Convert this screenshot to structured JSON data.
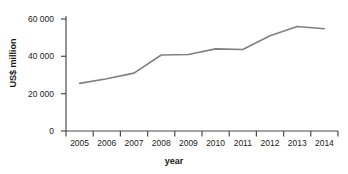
{
  "chart_data": {
    "type": "line",
    "title": "",
    "xlabel": "year",
    "ylabel": "US$ million",
    "x": [
      "2005",
      "2006",
      "2007",
      "2008",
      "2009",
      "2010",
      "2011",
      "2012",
      "2013",
      "2014"
    ],
    "categories": [
      "2005",
      "2006",
      "2007",
      "2008",
      "2009",
      "2010",
      "2011",
      "2012",
      "2013",
      "2014"
    ],
    "values": [
      25500,
      28000,
      31000,
      40700,
      41000,
      44000,
      43700,
      51000,
      56000,
      54800
    ],
    "series": [
      {
        "name": "US$ million",
        "values": [
          25500,
          28000,
          31000,
          40700,
          41000,
          44000,
          43700,
          51000,
          56000,
          54800
        ]
      }
    ],
    "ylim": [
      0,
      60000
    ],
    "ytick_values": [
      0,
      20000,
      40000,
      60000
    ],
    "ytick_labels": [
      "0",
      "20 000",
      "40 000",
      "60 000"
    ],
    "xtick_labels": [
      "2005",
      "2006",
      "2007",
      "2008",
      "2009",
      "2010",
      "2011",
      "2012",
      "2013",
      "2014"
    ],
    "grid": false,
    "legend": "none",
    "line_color": "#808080",
    "axis_color": "#4d4d4d",
    "text_color": "#222222",
    "background_color": "#ffffff"
  }
}
